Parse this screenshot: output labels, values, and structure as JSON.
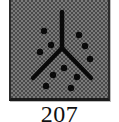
{
  "tile": {
    "pattern": "checkerboard",
    "colors": {
      "light": "#7a7a7a",
      "dark": "#4a4a4a",
      "border": "#2a2a2a",
      "glyph": "#0a0a0a"
    },
    "glyph": {
      "name": "inverted-y-fork-icon",
      "stem": {
        "x": 51,
        "y1": 14,
        "y2": 50
      },
      "left_arm": {
        "x1": 51,
        "y1": 50,
        "x2": 22,
        "y2": 80
      },
      "right_arm": {
        "x1": 51,
        "y1": 50,
        "x2": 80,
        "y2": 80
      }
    },
    "dots": [
      {
        "cx": 33,
        "cy": 33
      },
      {
        "cx": 40,
        "cy": 47
      },
      {
        "cx": 29,
        "cy": 54
      },
      {
        "cx": 68,
        "cy": 37
      },
      {
        "cx": 74,
        "cy": 48
      },
      {
        "cx": 79,
        "cy": 61
      },
      {
        "cx": 53,
        "cy": 70
      },
      {
        "cx": 42,
        "cy": 77
      },
      {
        "cx": 66,
        "cy": 79
      },
      {
        "cx": 35,
        "cy": 88
      },
      {
        "cx": 60,
        "cy": 90
      }
    ]
  },
  "caption": {
    "label": "207"
  }
}
